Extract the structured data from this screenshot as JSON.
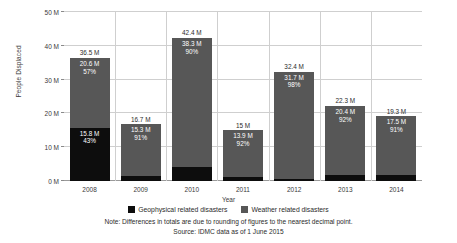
{
  "chart_data": {
    "type": "bar",
    "stacked": true,
    "title": "",
    "xlabel": "Year",
    "ylabel": "People Displaced",
    "ylim": [
      0,
      50
    ],
    "yticks": [
      "0 M",
      "10 M",
      "20 M",
      "30 M",
      "40 M",
      "50 M"
    ],
    "ytick_values": [
      0,
      10,
      20,
      30,
      40,
      50
    ],
    "grid": true,
    "legend_position": "bottom",
    "categories": [
      "2008",
      "2009",
      "2010",
      "2011",
      "2012",
      "2013",
      "2014"
    ],
    "series": [
      {
        "name": "Geophysical related disasters",
        "color": "#0d0d0d",
        "values": [
          15.8,
          1.5,
          4,
          1.1,
          0.7,
          1.8,
          1.7
        ],
        "value_labels": [
          "15.8 M",
          "1.5 M",
          "4 M",
          "1.1 M",
          "0.7 M",
          "1.8 M",
          "1.7 M"
        ],
        "percent_labels": [
          "43%",
          "9%",
          "10%",
          "8%",
          "2%",
          "8%",
          "9%"
        ]
      },
      {
        "name": "Weather related disasters",
        "color": "#575757",
        "values": [
          20.6,
          15.3,
          38.3,
          13.9,
          31.7,
          20.4,
          17.5
        ],
        "value_labels": [
          "20.6 M",
          "15.3 M",
          "38.3 M",
          "13.9 M",
          "31.7 M",
          "20.4 M",
          "17.5 M"
        ],
        "percent_labels": [
          "57%",
          "91%",
          "90%",
          "92%",
          "98%",
          "92%",
          "91%"
        ]
      }
    ],
    "totals": [
      36.5,
      16.7,
      42.4,
      15,
      32.4,
      22.3,
      19.3
    ],
    "total_labels": [
      "36.5 M",
      "16.7 M",
      "42.4 M",
      "15 M",
      "32.4 M",
      "22.3 M",
      "19.3 M"
    ],
    "annotations": {
      "note": "Note: Differences in totals are due to rounding of figures to the nearest decimal point.",
      "source": "Source: IDMC data as of 1 June 2015"
    }
  }
}
